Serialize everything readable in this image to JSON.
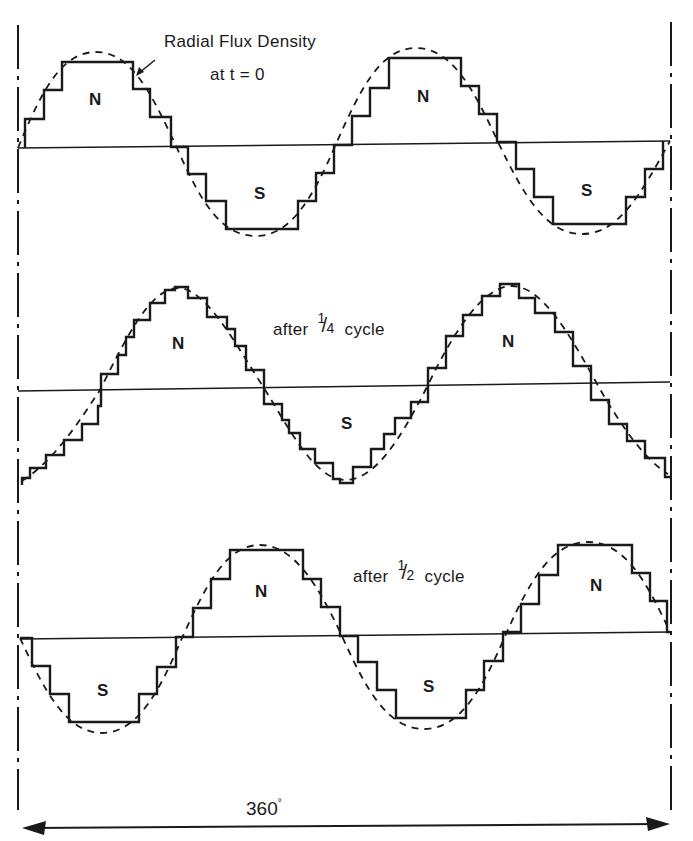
{
  "figure": {
    "boundary_lines": {
      "left_x": 18,
      "right_x": 670,
      "style": "dash-dot"
    },
    "span_label": "360",
    "span_unit": "°",
    "waves": [
      {
        "id": "t0",
        "caption_line1": "Radial Flux Density",
        "caption_line2": "at  t = 0",
        "pole_labels": [
          "N",
          "S",
          "N",
          "S"
        ],
        "baseline_y": 148
      },
      {
        "id": "quarter",
        "caption_prefix": "after",
        "caption_fraction_num": "1",
        "caption_fraction_den": "4",
        "caption_suffix": "cycle",
        "pole_labels": [
          "N",
          "S",
          "N"
        ],
        "baseline_y": 386
      },
      {
        "id": "half",
        "caption_prefix": "after",
        "caption_fraction_num": "1",
        "caption_fraction_den": "2",
        "caption_suffix": "cycle",
        "pole_labels": [
          "S",
          "N",
          "S",
          "N"
        ],
        "baseline_y": 637
      }
    ],
    "legend": {
      "stepped_curve": "MMF staircase (solid)",
      "dashed_curve": "sinusoidal fundamental (dashed)"
    }
  }
}
